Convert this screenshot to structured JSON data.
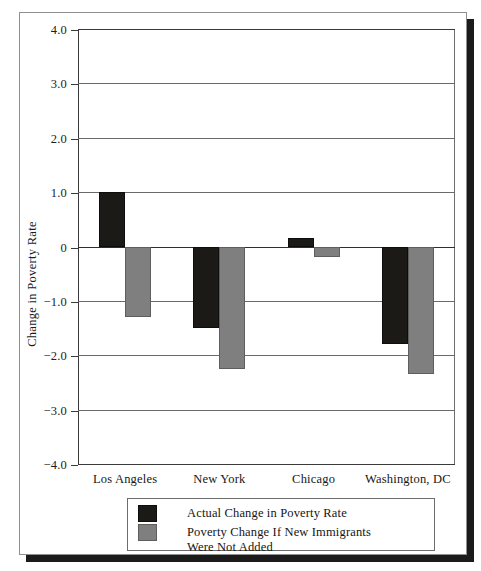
{
  "chart_data": {
    "type": "bar",
    "title": "",
    "xlabel": "",
    "ylabel": "Change in Poverty Rate",
    "categories": [
      "Los Angeles",
      "New York",
      "Chicago",
      "Washington, DC"
    ],
    "series": [
      {
        "name": "Actual Change in Poverty Rate",
        "color": "#1c1a17",
        "values": [
          1.0,
          -1.5,
          0.15,
          -1.8
        ]
      },
      {
        "name": "Poverty Change If New Immigrants Were Not Added",
        "color": "#7f7f7f",
        "values": [
          -1.3,
          -2.25,
          -0.2,
          -2.35
        ]
      }
    ],
    "ylim": [
      -4.0,
      4.0
    ],
    "yticks": [
      4.0,
      3.0,
      2.0,
      1.0,
      0,
      -1.0,
      -2.0,
      -3.0,
      -4.0
    ],
    "ytick_labels": [
      "4.0",
      "3.0",
      "2.0",
      "1.0",
      "0",
      "−1.0",
      "−2.0",
      "−3.0",
      "−4.0"
    ],
    "grid": true,
    "legend_position": "below"
  },
  "axis": {
    "y_title": "Change in Poverty Rate",
    "ticks": [
      {
        "value": 4.0,
        "label": "4.0"
      },
      {
        "value": 3.0,
        "label": "3.0"
      },
      {
        "value": 2.0,
        "label": "2.0"
      },
      {
        "value": 1.0,
        "label": "1.0"
      },
      {
        "value": 0,
        "label": "0"
      },
      {
        "value": -1.0,
        "label": "−1.0"
      },
      {
        "value": -2.0,
        "label": "−2.0"
      },
      {
        "value": -3.0,
        "label": "−3.0"
      },
      {
        "value": -4.0,
        "label": "−4.0"
      }
    ]
  },
  "categories": [
    {
      "label": "Los Angeles",
      "actual": 1.0,
      "no_immigrants": -1.3
    },
    {
      "label": "New York",
      "actual": -1.5,
      "no_immigrants": -2.25
    },
    {
      "label": "Chicago",
      "actual": 0.15,
      "no_immigrants": -0.2
    },
    {
      "label": "Washington, DC",
      "actual": -1.8,
      "no_immigrants": -2.35
    }
  ],
  "legend": {
    "entries": [
      {
        "label": "Actual Change in Poverty Rate",
        "color": "#1c1a17",
        "swatch": "black-square-swatch"
      },
      {
        "label": "Poverty Change If New Immigrants\nWere Not Added",
        "color": "#7f7f7f",
        "swatch": "gray-square-swatch"
      }
    ]
  },
  "colors": {
    "series_actual": "#1c1a17",
    "series_no_immigrants": "#7f7f7f",
    "gridline": "#6a6a6a",
    "axis": "#3a3a3a",
    "frame": "#8f8f8f",
    "shadow": "#1b1b1b",
    "background": "#ffffff"
  }
}
